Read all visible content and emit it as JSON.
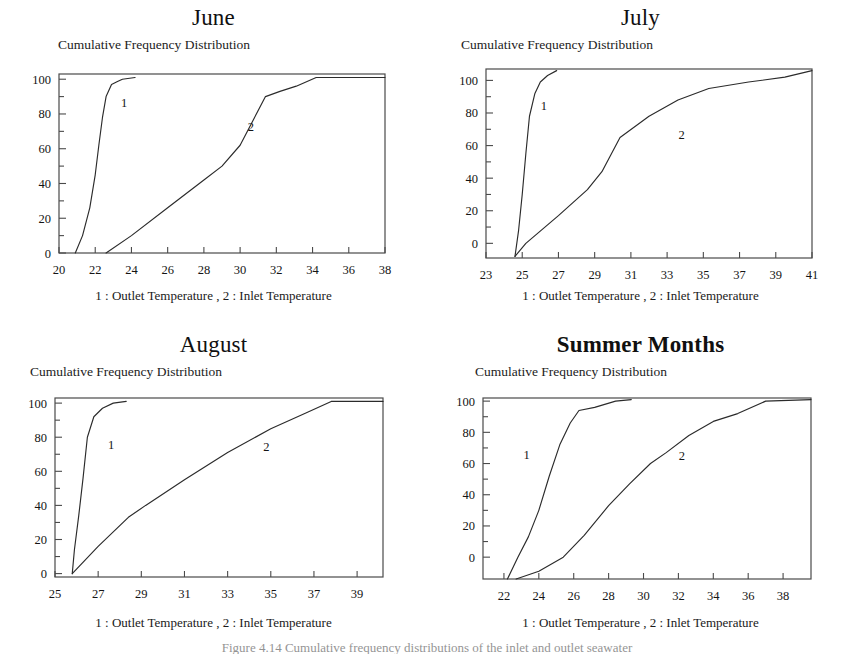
{
  "figure": {
    "background": "#ffffff",
    "ink_color": "#2b2b2b",
    "bottom_caption": "Figure 4.14 Cumulative frequency distributions of the inlet and outlet seawater"
  },
  "common": {
    "subtitle": "Cumulative Frequency Distribution",
    "caption": "1 : Outlet Temperature , 2 : Inlet Temperature",
    "series1_label": "1",
    "series2_label": "2"
  },
  "chart_data": [
    {
      "id": "june",
      "type": "line",
      "title": "June",
      "title_bold": false,
      "subtitle": "Cumulative Frequency Distribution",
      "xlabel": "",
      "ylabel": "",
      "caption": "1 : Outlet Temperature , 2 : Inlet Temperature",
      "xlim": [
        20,
        38
      ],
      "ylim": [
        0,
        103
      ],
      "xticks": [
        20,
        22,
        24,
        26,
        28,
        30,
        32,
        34,
        36,
        38
      ],
      "yticks": [
        0,
        20,
        40,
        60,
        80,
        100
      ],
      "xtick_labels": [
        "20",
        "22",
        "24",
        "26",
        "28",
        "30",
        "32",
        "34",
        "36",
        "38"
      ],
      "ytick_labels": [
        "0",
        "20",
        "40",
        "60",
        "80",
        "100"
      ],
      "grid": false,
      "legend_position": "inline-annotation",
      "series": [
        {
          "name": "1",
          "label": "Outlet Temperature",
          "label_x": 23.6,
          "label_y": 84,
          "x": [
            20.9,
            21.3,
            21.7,
            22.0,
            22.2,
            22.4,
            22.6,
            22.9,
            23.2,
            23.5,
            24.2
          ],
          "y": [
            0,
            10,
            26,
            45,
            62,
            78,
            90,
            97,
            98.5,
            100,
            101
          ]
        },
        {
          "name": "2",
          "label": "Inlet Temperature",
          "label_x": 30.6,
          "label_y": 70,
          "x": [
            22.6,
            24.0,
            26.0,
            28.0,
            29.0,
            30.0,
            31.4,
            32.2,
            33.1,
            34.2,
            36.0,
            38.0
          ],
          "y": [
            0,
            10,
            26,
            42,
            50,
            62,
            90,
            93,
            96,
            101,
            101,
            101
          ]
        }
      ]
    },
    {
      "id": "july",
      "type": "line",
      "title": "July",
      "title_bold": false,
      "subtitle": "Cumulative Frequency Distribution",
      "xlabel": "",
      "ylabel": "",
      "caption": "1 : Outlet Temperature , 2 : Inlet Temperature",
      "xlim": [
        23,
        41
      ],
      "ylim": [
        -9,
        107
      ],
      "xticks": [
        23,
        25,
        27,
        29,
        31,
        33,
        35,
        37,
        39,
        41
      ],
      "yticks": [
        0,
        20,
        40,
        60,
        80,
        100
      ],
      "xtick_labels": [
        "23",
        "25",
        "27",
        "29",
        "31",
        "33",
        "35",
        "37",
        "39",
        "41"
      ],
      "ytick_labels": [
        "0",
        "20",
        "40",
        "60",
        "80",
        "100"
      ],
      "grid": false,
      "legend_position": "inline-annotation",
      "series": [
        {
          "name": "1",
          "label": "Outlet Temperature",
          "label_x": 26.2,
          "label_y": 82,
          "x": [
            24.6,
            24.8,
            25.0,
            25.2,
            25.4,
            25.7,
            26.0,
            26.4,
            26.9
          ],
          "y": [
            -8,
            8,
            30,
            55,
            78,
            92,
            99,
            103,
            106
          ]
        },
        {
          "name": "2",
          "label": "Inlet Temperature",
          "label_x": 33.8,
          "label_y": 64,
          "x": [
            24.6,
            25.2,
            27.0,
            28.6,
            29.4,
            30.4,
            32.0,
            33.6,
            35.3,
            37.5,
            39.5,
            41.0
          ],
          "y": [
            -8,
            0,
            17,
            33,
            44,
            65,
            78,
            88,
            95,
            99,
            102,
            106
          ]
        }
      ]
    },
    {
      "id": "august",
      "type": "line",
      "title": "August",
      "title_bold": false,
      "subtitle": "Cumulative Frequency Distribution",
      "xlabel": "",
      "ylabel": "",
      "caption": "1 : Outlet Temperature , 2 : Inlet Temperature",
      "xlim": [
        25,
        40.2
      ],
      "ylim": [
        -2,
        103
      ],
      "xticks": [
        25,
        27,
        29,
        31,
        33,
        35,
        37,
        39
      ],
      "yticks": [
        0,
        20,
        40,
        60,
        80,
        100
      ],
      "xtick_labels": [
        "25",
        "27",
        "29",
        "31",
        "33",
        "35",
        "37",
        "39"
      ],
      "ytick_labels": [
        "0",
        "20",
        "40",
        "60",
        "80",
        "100"
      ],
      "grid": false,
      "legend_position": "inline-annotation",
      "series": [
        {
          "name": "1",
          "label": "Outlet Temperature",
          "label_x": 27.6,
          "label_y": 73,
          "x": [
            25.8,
            25.9,
            26.1,
            26.3,
            26.5,
            26.8,
            27.2,
            27.7,
            28.3
          ],
          "y": [
            0,
            14,
            34,
            56,
            80,
            92,
            97,
            100,
            101
          ]
        },
        {
          "name": "2",
          "label": "Inlet Temperature",
          "label_x": 34.8,
          "label_y": 72,
          "x": [
            25.8,
            27.0,
            28.4,
            29.2,
            31.0,
            33.0,
            35.0,
            36.6,
            37.8,
            40.2
          ],
          "y": [
            0,
            16,
            33,
            40,
            55,
            71,
            85,
            94,
            101,
            101
          ]
        }
      ]
    },
    {
      "id": "summer",
      "type": "line",
      "title": "Summer Months",
      "title_bold": true,
      "subtitle": "Cumulative Frequency Distribution",
      "xlabel": "",
      "ylabel": "",
      "caption": "1 : Outlet Temperature , 2 : Inlet Temperature",
      "xlim": [
        20.8,
        39.6
      ],
      "ylim": [
        -14,
        102
      ],
      "xticks": [
        22,
        24,
        26,
        28,
        30,
        32,
        34,
        36,
        38
      ],
      "yticks": [
        0,
        20,
        40,
        60,
        80,
        100
      ],
      "xtick_labels": [
        "22",
        "24",
        "26",
        "28",
        "30",
        "32",
        "34",
        "36",
        "38"
      ],
      "ytick_labels": [
        "0",
        "20",
        "40",
        "60",
        "80",
        "100"
      ],
      "grid": false,
      "legend_position": "inline-annotation",
      "series": [
        {
          "name": "1",
          "label": "Outlet Temperature",
          "label_x": 23.3,
          "label_y": 63,
          "x": [
            22.2,
            22.8,
            23.4,
            24.0,
            24.6,
            25.2,
            25.8,
            26.3,
            27.2,
            28.4,
            29.3
          ],
          "y": [
            -14,
            0,
            13,
            30,
            52,
            72,
            86,
            94,
            96,
            100,
            101
          ]
        },
        {
          "name": "2",
          "label": "Inlet Temperature",
          "label_x": 32.2,
          "label_y": 62,
          "x": [
            22.7,
            24.0,
            25.4,
            26.6,
            28.0,
            29.2,
            30.4,
            31.3,
            32.6,
            34.0,
            35.4,
            37.0,
            39.6
          ],
          "y": [
            -14,
            -9,
            0,
            14,
            33,
            47,
            60,
            67,
            78,
            87,
            92,
            100,
            101
          ]
        }
      ]
    }
  ]
}
